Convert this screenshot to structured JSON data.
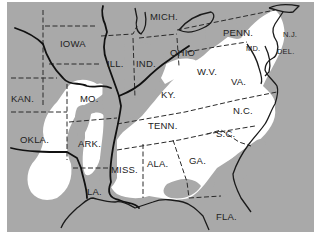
{
  "map": {
    "colors": {
      "background": "#a9a9a9",
      "highlight": "#ffffff",
      "lines": "#222222",
      "page": "#ffffff"
    },
    "states": [
      {
        "label": "MICH.",
        "x": 143,
        "y": 18
      },
      {
        "label": "IOWA",
        "x": 53,
        "y": 45
      },
      {
        "label": "ILL.",
        "x": 100,
        "y": 65
      },
      {
        "label": "IND.",
        "x": 129,
        "y": 65
      },
      {
        "label": "OHIO",
        "x": 163,
        "y": 54
      },
      {
        "label": "PENN.",
        "x": 216,
        "y": 34
      },
      {
        "label": "W.V.",
        "x": 190,
        "y": 73
      },
      {
        "label": "VA.",
        "x": 224,
        "y": 83
      },
      {
        "label": "KY.",
        "x": 154,
        "y": 96
      },
      {
        "label": "KAN.",
        "x": 4,
        "y": 100
      },
      {
        "label": "MO.",
        "x": 73,
        "y": 100
      },
      {
        "label": "TENN.",
        "x": 141,
        "y": 127
      },
      {
        "label": "N.C.",
        "x": 226,
        "y": 112
      },
      {
        "label": "S.C.",
        "x": 209,
        "y": 135
      },
      {
        "label": "OKLA.",
        "x": 13,
        "y": 141
      },
      {
        "label": "ARK.",
        "x": 71,
        "y": 145
      },
      {
        "label": "MISS.",
        "x": 104,
        "y": 171
      },
      {
        "label": "ALA.",
        "x": 140,
        "y": 165
      },
      {
        "label": "GA.",
        "x": 182,
        "y": 162
      },
      {
        "label": "LA.",
        "x": 80,
        "y": 193
      },
      {
        "label": "FLA.",
        "x": 209,
        "y": 218
      }
    ],
    "small_states": [
      {
        "label": "MD.",
        "x": 239,
        "y": 49
      },
      {
        "label": "N.J.",
        "x": 276,
        "y": 35
      },
      {
        "label": "DEL.",
        "x": 270,
        "y": 52
      }
    ]
  }
}
